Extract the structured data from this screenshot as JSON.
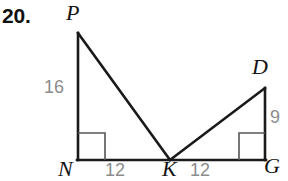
{
  "problem": {
    "number": "20."
  },
  "figure": {
    "vertices": [
      {
        "name": "P",
        "label": "P",
        "x": 78,
        "y": 33
      },
      {
        "name": "N",
        "label": "N",
        "x": 78,
        "y": 160
      },
      {
        "name": "K",
        "label": "K",
        "x": 170,
        "y": 160
      },
      {
        "name": "G",
        "label": "G",
        "x": 265,
        "y": 160
      },
      {
        "name": "D",
        "label": "D",
        "x": 265,
        "y": 88
      }
    ],
    "measures": [
      {
        "name": "side-PN",
        "label": "16",
        "position": "left"
      },
      {
        "name": "side-DG",
        "label": "9",
        "position": "right"
      },
      {
        "name": "side-NK",
        "label": "12",
        "position": "bottom-left"
      },
      {
        "name": "side-KG",
        "label": "12",
        "position": "bottom-right"
      }
    ],
    "right_angles": [
      {
        "name": "right-angle-N",
        "at": "N"
      },
      {
        "name": "right-angle-G",
        "at": "G"
      }
    ],
    "colors": {
      "stroke": "#1a1a1a",
      "measure_text": "#8c8c8c",
      "vertex_text": "#141414",
      "right_angle_stroke": "#555555",
      "background": "#ffffff"
    }
  }
}
